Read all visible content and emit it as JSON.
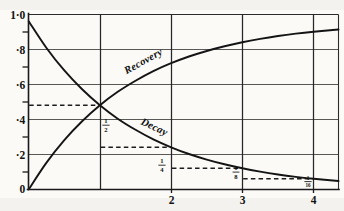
{
  "chart_data": {
    "type": "line",
    "title": "",
    "subtitle": "",
    "xlabel": "",
    "ylabel": "",
    "xlim": [
      0,
      4.35
    ],
    "ylim": [
      0,
      1.04
    ],
    "grid": true,
    "legend_position": "inline-on-curve",
    "x_ticks": [
      {
        "value": 1,
        "label": ""
      },
      {
        "value": 2,
        "label": "2"
      },
      {
        "value": 3,
        "label": "3"
      },
      {
        "value": 4,
        "label": "4"
      }
    ],
    "y_ticks": [
      {
        "value": 0,
        "label": "0"
      },
      {
        "value": 0.2,
        "label": "·2"
      },
      {
        "value": 0.4,
        "label": "·4"
      },
      {
        "value": 0.6,
        "label": "·6"
      },
      {
        "value": 0.8,
        "label": "·8"
      },
      {
        "value": 1.0,
        "label": "1·0"
      }
    ],
    "y_minor_ticks": [
      0.1,
      0.3,
      0.5,
      0.7,
      0.9
    ],
    "series": [
      {
        "name": "Decay",
        "label": "Decay",
        "formula": "y = 2^(-t)",
        "color": "#141414",
        "x": [
          0,
          0.25,
          0.5,
          0.75,
          1,
          1.25,
          1.5,
          1.75,
          2,
          2.25,
          2.5,
          2.75,
          3,
          3.25,
          3.5,
          3.75,
          4,
          4.35
        ],
        "values": [
          1.0,
          0.841,
          0.707,
          0.595,
          0.5,
          0.42,
          0.354,
          0.297,
          0.25,
          0.21,
          0.177,
          0.149,
          0.125,
          0.105,
          0.088,
          0.074,
          0.0625,
          0.049
        ]
      },
      {
        "name": "Recovery",
        "label": "Recovery",
        "formula": "y = 1 - 2^(-t)",
        "color": "#141414",
        "x": [
          0,
          0.25,
          0.5,
          0.75,
          1,
          1.25,
          1.5,
          1.75,
          2,
          2.25,
          2.5,
          2.75,
          3,
          3.25,
          3.5,
          3.75,
          4,
          4.35
        ],
        "values": [
          0.0,
          0.159,
          0.293,
          0.405,
          0.5,
          0.58,
          0.646,
          0.703,
          0.75,
          0.79,
          0.823,
          0.851,
          0.875,
          0.895,
          0.912,
          0.926,
          0.9375,
          0.951
        ]
      }
    ],
    "annotations": [
      {
        "name": "half-marker",
        "fraction_numerator": "1",
        "fraction_denominator": "2",
        "value": 0.5,
        "at_x": 1,
        "leader_from_x": 0,
        "leader_to_x": 1
      },
      {
        "name": "quarter-marker",
        "fraction_numerator": "1",
        "fraction_denominator": "4",
        "value": 0.25,
        "at_x": 2,
        "leader_from_x": 1,
        "leader_to_x": 2
      },
      {
        "name": "eighth-marker",
        "fraction_numerator": "1",
        "fraction_denominator": "8",
        "value": 0.125,
        "at_x": 3,
        "leader_from_x": 2,
        "leader_to_x": 3
      },
      {
        "name": "sixteenth-marker",
        "fraction_numerator": "1",
        "fraction_denominator": "16",
        "value": 0.0625,
        "at_x": 4,
        "leader_from_x": 3,
        "leader_to_x": 4
      }
    ]
  },
  "labels": {
    "y_1_0": "1·0",
    "y_0_8": "·8",
    "y_0_6": "·6",
    "y_0_4": "·4",
    "y_0_2": "·2",
    "y_0": "0",
    "x_2": "2",
    "x_3": "3",
    "x_4": "4",
    "recovery": "Recovery",
    "decay": "Decay",
    "frac_half_num": "1",
    "frac_half_den": "2",
    "frac_quarter_num": "1",
    "frac_quarter_den": "4",
    "frac_eighth_num": "1",
    "frac_eighth_den": "8",
    "frac_sixteenth_num": "1",
    "frac_sixteenth_den": "16"
  },
  "colors": {
    "curve": "#141414",
    "grid": "#3a3a3a",
    "axis": "#1a1a1a",
    "background": "#fbfaf7"
  }
}
